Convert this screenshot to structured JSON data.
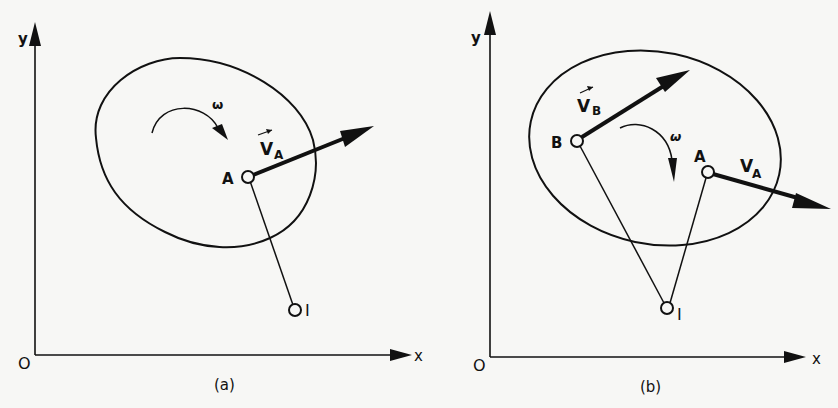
{
  "figure": {
    "background": "#f7f7f5",
    "ink": "#111111",
    "panels": [
      {
        "id": "a",
        "caption": "(a)",
        "axis_labels": {
          "x": "x",
          "y": "y",
          "origin": "O"
        },
        "omega_label": "ω",
        "points": [
          {
            "name": "A",
            "label": "A"
          },
          {
            "name": "I",
            "label": "I"
          }
        ],
        "vectors": [
          {
            "name": "V_A",
            "label_main": "V",
            "label_sub": "A",
            "overarrow": true
          }
        ]
      },
      {
        "id": "b",
        "caption": "(b)",
        "axis_labels": {
          "x": "x",
          "y": "y",
          "origin": "O"
        },
        "omega_label": "ω",
        "points": [
          {
            "name": "B",
            "label": "B"
          },
          {
            "name": "A",
            "label": "A"
          },
          {
            "name": "I",
            "label": "I"
          }
        ],
        "vectors": [
          {
            "name": "V_B",
            "label_main": "V",
            "label_sub": "B",
            "overarrow": true
          },
          {
            "name": "V_A",
            "label_main": "V",
            "label_sub": "A",
            "overarrow": false
          }
        ]
      }
    ]
  }
}
